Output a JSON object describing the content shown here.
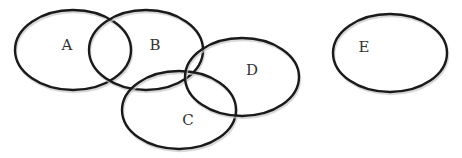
{
  "diagram": {
    "type": "set-diagram",
    "line_color": "#1a1a1a",
    "label_color": "#333333",
    "sets": [
      {
        "id": "A",
        "label": "A"
      },
      {
        "id": "B",
        "label": "B"
      },
      {
        "id": "C",
        "label": "C"
      },
      {
        "id": "D",
        "label": "D"
      },
      {
        "id": "E",
        "label": "E"
      }
    ],
    "overlaps": [
      [
        "A",
        "B"
      ],
      [
        "B",
        "C"
      ],
      [
        "B",
        "D"
      ],
      [
        "C",
        "D"
      ]
    ],
    "disjoint": [
      "E"
    ]
  }
}
